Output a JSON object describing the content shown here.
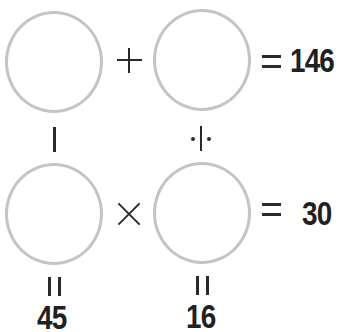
{
  "puzzle": {
    "row1": {
      "operator": "+",
      "result": "146"
    },
    "row2": {
      "operator": "×",
      "result": "30"
    },
    "column1": {
      "operator": "−",
      "result": "45"
    },
    "column2": {
      "operator": "÷",
      "result": "16"
    },
    "cells": [
      "",
      "",
      "",
      ""
    ]
  },
  "colors": {
    "circle_stroke": "#c4c4c4",
    "text": "#231f20",
    "background": "#ffffff"
  }
}
